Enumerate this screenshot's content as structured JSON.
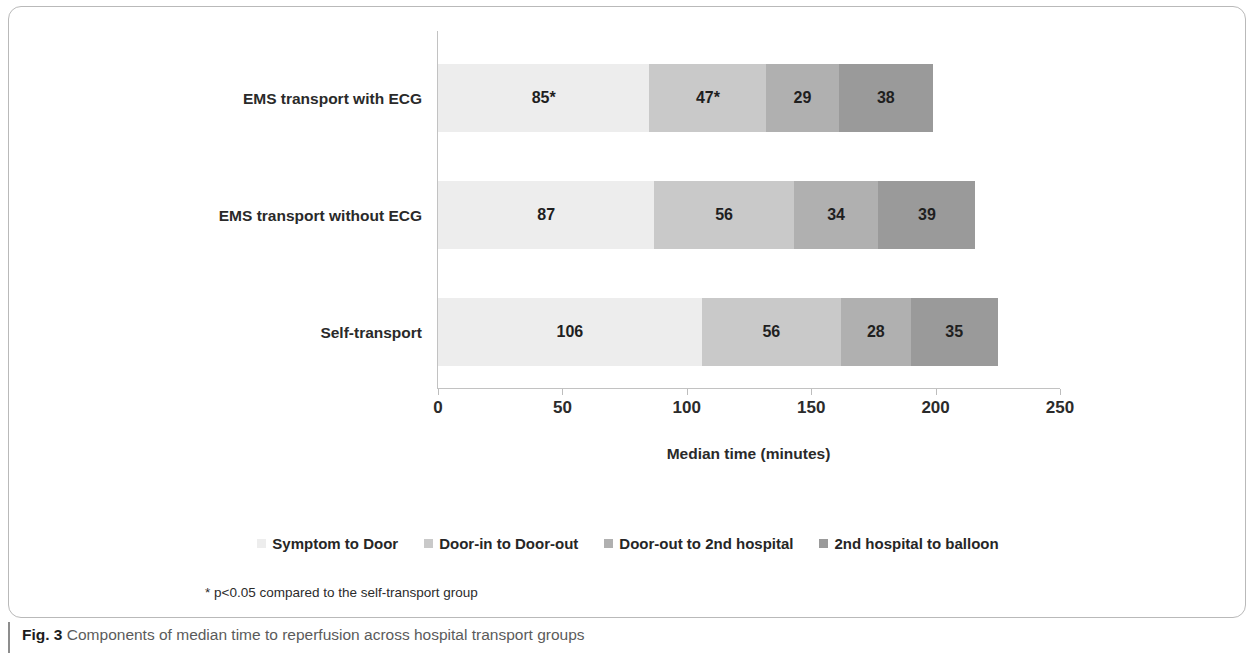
{
  "figure": {
    "caption_label": "Fig. 3",
    "caption_text": "Components of median time to reperfusion across hospital transport groups",
    "footnote": "* p<0.05 compared to the self-transport group"
  },
  "chart_data": {
    "type": "bar",
    "orientation": "horizontal",
    "stacked": true,
    "title": "",
    "xlabel": "Median time (minutes)",
    "ylabel": "",
    "xlim": [
      0,
      250
    ],
    "xticks": [
      0,
      50,
      100,
      150,
      200,
      250
    ],
    "xtick_labels": [
      "0",
      "50",
      "100",
      "150",
      "200",
      "250"
    ],
    "grid": false,
    "legend_position": "bottom",
    "categories": [
      "EMS transport with ECG",
      "EMS transport without ECG",
      "Self-transport"
    ],
    "series": [
      {
        "name": "Symptom to Door",
        "color": "#ededed",
        "values": [
          85,
          87,
          106
        ],
        "labels": [
          "85*",
          "87",
          "106"
        ]
      },
      {
        "name": "Door-in to Door-out",
        "color": "#c9c9c9",
        "values": [
          47,
          56,
          56
        ],
        "labels": [
          "47*",
          "56",
          "56"
        ]
      },
      {
        "name": "Door-out to 2nd hospital",
        "color": "#b0b0b0",
        "values": [
          29,
          34,
          28
        ],
        "labels": [
          "29",
          "34",
          "28"
        ]
      },
      {
        "name": "2nd hospital to balloon",
        "color": "#9a9a9a",
        "values": [
          38,
          39,
          35
        ],
        "labels": [
          "38",
          "39",
          "35"
        ]
      }
    ],
    "totals": [
      199,
      216,
      225
    ]
  }
}
